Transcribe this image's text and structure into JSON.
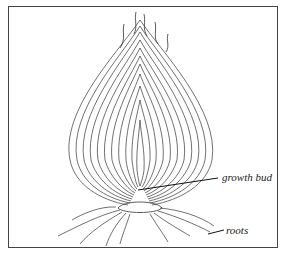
{
  "diagram": {
    "labels": {
      "growth_bud": "growth bud",
      "roots": "roots"
    }
  }
}
